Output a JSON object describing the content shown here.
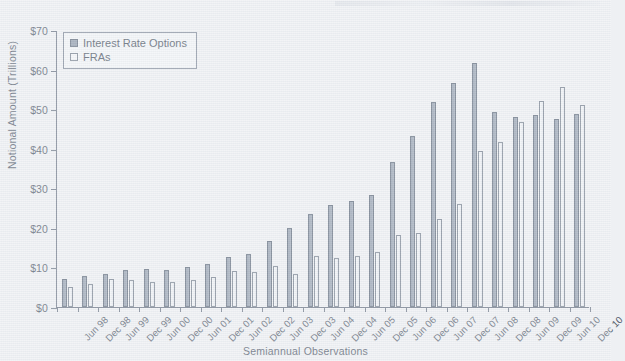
{
  "chart_data": {
    "type": "bar",
    "title": "",
    "xlabel": "Semiannual Observations",
    "ylabel": "Notional Amount (Trillions)",
    "ylim": [
      0,
      70
    ],
    "yticks": [
      0,
      10,
      20,
      30,
      40,
      50,
      60,
      70
    ],
    "ytick_labels": [
      "$0",
      "$10",
      "$20",
      "$30",
      "$40",
      "$50",
      "$60",
      "$70"
    ],
    "grid": false,
    "legend_position": "upper left",
    "categories": [
      "Jun 98",
      "Dec 98",
      "Jun 99",
      "Dec 99",
      "Jun 00",
      "Dec 00",
      "Jun 01",
      "Dec 01",
      "Jun 02",
      "Dec 02",
      "Jun 03",
      "Dec 03",
      "Jun 04",
      "Dec 04",
      "Jun 05",
      "Dec 05",
      "Jun 06",
      "Dec 06",
      "Jun 07",
      "Dec 07",
      "Jun 08",
      "Dec 08",
      "Jun 09",
      "Dec 09",
      "Jun 10",
      "Dec 10"
    ],
    "series": [
      {
        "name": "Interest Rate Options",
        "color": "#8e9aab",
        "edge_color": "#5e6a7b",
        "values": [
          7.0,
          7.9,
          8.4,
          9.4,
          9.5,
          9.4,
          10.0,
          10.9,
          12.6,
          13.5,
          16.8,
          20.0,
          23.6,
          25.8,
          26.8,
          28.4,
          36.6,
          43.2,
          51.8,
          56.6,
          61.6,
          49.4,
          48.0,
          48.4,
          47.4,
          48.8
        ]
      },
      {
        "name": "FRAs",
        "color": "#f3f5f8",
        "edge_color": "#76818f",
        "values": [
          5.1,
          5.8,
          7.1,
          6.8,
          6.4,
          6.4,
          6.8,
          7.7,
          9.1,
          8.8,
          10.3,
          8.4,
          12.8,
          12.4,
          13.0,
          14.0,
          18.1,
          18.7,
          22.3,
          26.0,
          39.4,
          41.6,
          46.8,
          52.0,
          55.5,
          51.0
        ]
      }
    ]
  }
}
